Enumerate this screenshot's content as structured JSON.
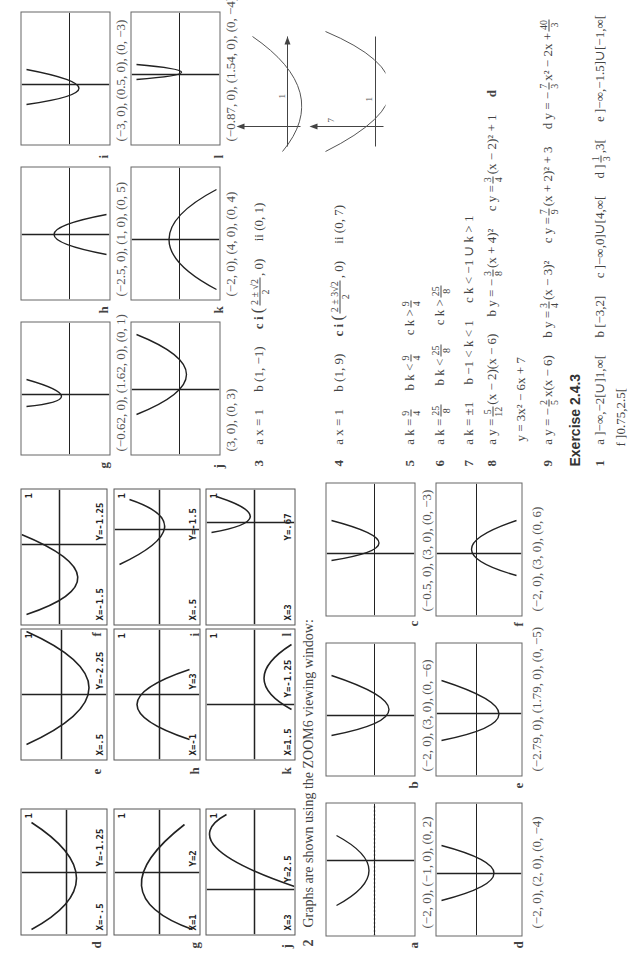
{
  "calc_screens": [
    {
      "id": "d",
      "x_label": "X=-.5",
      "y_label": "Y=-1.25"
    },
    {
      "id": "e",
      "x_label": "X=.5",
      "y_label": "Y=-2.25"
    },
    {
      "id": "f",
      "x_label": "X=-1.5",
      "y_label": "Y=-1.25"
    },
    {
      "id": "g",
      "x_label": "X=1",
      "y_label": "Y=2"
    },
    {
      "id": "h",
      "x_label": "X=-1",
      "y_label": "Y=3"
    },
    {
      "id": "i",
      "x_label": "X=.5",
      "y_label": "Y=-1.5"
    },
    {
      "id": "j",
      "x_label": "X=3",
      "y_label": "Y=2.5"
    },
    {
      "id": "k",
      "x_label": "X=1.5",
      "y_label": "Y=-1.25"
    },
    {
      "id": "l",
      "x_label": "X=3",
      "y_label": "Y=.67"
    }
  ],
  "calc_corner_marker": "1",
  "question2": {
    "number": "2",
    "intro": "Graphs are shown using the ZOOM6 viewing window:",
    "graphs": [
      {
        "id": "a",
        "caption": "(−2, 0), (−1, 0), (0, 2)"
      },
      {
        "id": "b",
        "caption": "(−2, 0), (3, 0), (0, −6)"
      },
      {
        "id": "c",
        "caption": "(−0.5, 0), (3, 0), (0, −3)"
      },
      {
        "id": "d",
        "caption": "(−2, 0), (2, 0), (0, −4)"
      },
      {
        "id": "e",
        "caption": "(−2.79, 0), (1.79, 0), (0, −5)"
      },
      {
        "id": "f",
        "caption": "(−2, 0), (3, 0), (0, 6)"
      },
      {
        "id": "g",
        "caption": "(−0.62, 0), (1.62, 0), (0, 1)"
      },
      {
        "id": "h",
        "caption": "(−2.5, 0), (1, 0), (0, 5)"
      },
      {
        "id": "i",
        "caption": "(−3, 0), (0.5, 0), (0, −3)"
      },
      {
        "id": "j",
        "caption": "(3, 0), (0, 3)"
      },
      {
        "id": "k",
        "caption": "(−2, 0), (4, 0), (0, 4)"
      },
      {
        "id": "l",
        "caption": "(−0.87, 0), (1.54, 0), (0, −4)"
      }
    ]
  },
  "answers": {
    "q3": {
      "num": "3",
      "a": "a x = 1",
      "b": "b (1, −1)",
      "ci": "c i",
      "ci_num": "2 ± √2",
      "ci_den": "2",
      "ci_tail": ", 0)",
      "ii": "ii (0, 1)",
      "sketch_tick": "1"
    },
    "q4": {
      "num": "4",
      "a": "a x = 1",
      "b": "b (1, 9)",
      "ci": "c i",
      "ci_num": "2 ± 3√2",
      "ci_den": "2",
      "ci_tail": ", 0)",
      "ii": "ii (0, 7)",
      "sketch_tick": "1",
      "sketch_label": "7"
    },
    "q5": {
      "num": "5",
      "a_pre": "a k =",
      "a_n": "9",
      "a_d": "4",
      "b_pre": "b k <",
      "b_n": "9",
      "b_d": "4",
      "c_pre": "c k >",
      "c_n": "9",
      "c_d": "4"
    },
    "q6": {
      "num": "6",
      "a_pre": "a k =",
      "a_n": "25",
      "a_d": "8",
      "b_pre": "b k <",
      "b_n": "25",
      "b_d": "8",
      "c_pre": "c k >",
      "c_n": "25",
      "c_d": "8"
    },
    "q7": {
      "num": "7",
      "a": "a k = ±1",
      "b": "b −1 < k < 1",
      "c": "c k < −1 ∪ k > 1"
    },
    "q8": {
      "num": "8",
      "a_pre": "a y =",
      "a_n": "5",
      "a_d": "12",
      "a_post": "(x − 2)(x − 6)",
      "b_pre": "b y = −",
      "b_n": "3",
      "b_d": "8",
      "b_post": "(x + 4)²",
      "c_pre": "c y =",
      "c_n": "3",
      "c_d": "4",
      "c_post": "(x − 2)² + 1",
      "d": "d",
      "extra": "y = 3x² − 6x + 7"
    },
    "q9": {
      "num": "9",
      "a_pre": "a y = −",
      "a_n": "2",
      "a_d": "5",
      "a_post": "x(x − 6)",
      "b_pre": "b y =",
      "b_n": "3",
      "b_d": "4",
      "b_post": "(x − 3)²",
      "c_pre": "c y =",
      "c_n": "7",
      "c_d": "9",
      "c_post": "(x + 2)² + 3",
      "d_pre": "d y = −",
      "d_n": "7",
      "d_d": "3",
      "d_mid": "x² − 2x +",
      "d_n2": "40",
      "d_d2": "3"
    }
  },
  "exercise": {
    "title": "Exercise 2.4.3",
    "q1": {
      "num": "1",
      "a": "a ]−∞,−2[∪]1,∞[",
      "b": "b [−3,2]",
      "c": "c ]−∞,0]∪[4,∞[",
      "d_pre": "d ]",
      "d_n": "1",
      "d_d": "3",
      "d_post": ",3[",
      "e": "e ]−∞,−1.5]∪[−1,∞[",
      "f": "f ]0.75,2.5["
    }
  }
}
